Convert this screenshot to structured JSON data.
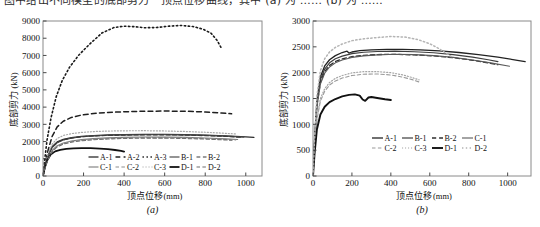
{
  "top_caption": "图中给出不同模型的底部剪力－顶点位移曲线，其中  (a)  为  ……  (b)  为  ……",
  "figure_a": {
    "panel_label": "(a)",
    "axis": {
      "y_title": "底部剪力",
      "y_unit": "(kN)",
      "x_title": "顶点位移",
      "x_unit": "(mm)",
      "x_ticks": [
        0,
        200,
        400,
        600,
        800,
        1000
      ],
      "y_ticks": [
        0,
        1000,
        2000,
        3000,
        4000,
        5000,
        6000,
        7000,
        8000,
        9000
      ],
      "xlim": [
        0,
        1080
      ],
      "ylim": [
        0,
        9000
      ]
    },
    "legend_rows": [
      [
        "A-1",
        "A-2",
        "A-3",
        "B-1",
        "B-2"
      ],
      [
        "C-1",
        "C-2",
        "C-3",
        "D-1",
        "D-2"
      ]
    ]
  },
  "figure_b": {
    "panel_label": "(b)",
    "axis": {
      "y_title": "底部剪力",
      "y_unit": "(kN)",
      "x_title": "顶点位移",
      "x_unit": "(mm)",
      "x_ticks": [
        0,
        200,
        400,
        600,
        800,
        1000
      ],
      "y_ticks": [
        0,
        500,
        1000,
        1500,
        2000,
        2500,
        3000
      ],
      "xlim": [
        0,
        1120
      ],
      "ylim": [
        0,
        3000
      ]
    },
    "legend_rows": [
      [
        "A-1",
        "B-1",
        "B-2",
        "C-1"
      ],
      [
        "C-2",
        "C-3",
        "D-1",
        "D-2"
      ]
    ]
  },
  "chart_data": [
    {
      "type": "line",
      "title": "",
      "panel": "(a)",
      "xlabel": "顶点位移(mm)",
      "ylabel": "底部剪力(kN)",
      "xlim": [
        0,
        1080
      ],
      "ylim": [
        0,
        9000
      ],
      "xticks": [
        0,
        200,
        400,
        600,
        800,
        1000
      ],
      "yticks": [
        0,
        1000,
        2000,
        3000,
        4000,
        5000,
        6000,
        7000,
        8000,
        9000
      ],
      "grid": false,
      "legend_position": "lower-center-inside",
      "series": [
        {
          "name": "A-1",
          "style": "solid",
          "color": "#2b2b2b",
          "width": 1.3,
          "x": [
            0,
            10,
            25,
            45,
            70,
            100,
            140,
            190,
            250,
            320,
            400,
            500,
            600,
            700,
            800,
            900,
            1000,
            1040
          ],
          "y": [
            0,
            600,
            1200,
            1700,
            1980,
            2130,
            2230,
            2300,
            2350,
            2385,
            2405,
            2420,
            2420,
            2405,
            2375,
            2330,
            2270,
            2240
          ]
        },
        {
          "name": "A-2",
          "style": "dashed",
          "color": "#1f1f1f",
          "width": 1.5,
          "x": [
            0,
            10,
            25,
            45,
            70,
            100,
            140,
            190,
            250,
            320,
            400,
            500,
            600,
            700,
            800,
            880,
            930
          ],
          "y": [
            0,
            700,
            1500,
            2300,
            2850,
            3180,
            3400,
            3540,
            3630,
            3690,
            3730,
            3760,
            3770,
            3760,
            3720,
            3660,
            3610
          ]
        },
        {
          "name": "A-3",
          "style": "dotted",
          "color": "#1a1a1a",
          "width": 1.6,
          "x": [
            0,
            8,
            20,
            40,
            65,
            95,
            130,
            175,
            225,
            290,
            350,
            400,
            450,
            500,
            560,
            620,
            680,
            740,
            790,
            830,
            860,
            880
          ],
          "y": [
            0,
            900,
            2100,
            3400,
            4600,
            5550,
            6300,
            7000,
            7600,
            8300,
            8620,
            8700,
            8670,
            8610,
            8620,
            8700,
            8740,
            8680,
            8520,
            8280,
            7850,
            7420
          ]
        },
        {
          "name": "B-1",
          "style": "solid",
          "color": "#4d4d4d",
          "width": 1.2,
          "x": [
            0,
            10,
            25,
            45,
            70,
            100,
            140,
            190,
            250,
            320,
            400,
            500,
            600,
            700,
            800,
            900,
            990
          ],
          "y": [
            0,
            560,
            1150,
            1650,
            1930,
            2090,
            2200,
            2280,
            2330,
            2365,
            2385,
            2400,
            2400,
            2385,
            2355,
            2310,
            2255
          ]
        },
        {
          "name": "B-2",
          "style": "dashed",
          "color": "#3a3a3a",
          "width": 1.2,
          "x": [
            0,
            10,
            25,
            45,
            70,
            100,
            140,
            190,
            250,
            320,
            400,
            500,
            600,
            700,
            800,
            900,
            980
          ],
          "y": [
            0,
            580,
            1180,
            1680,
            1950,
            2100,
            2200,
            2275,
            2325,
            2355,
            2375,
            2390,
            2390,
            2375,
            2345,
            2300,
            2245
          ]
        },
        {
          "name": "C-1",
          "style": "solid",
          "color": "#7a7a7a",
          "width": 1.1,
          "x": [
            0,
            10,
            25,
            45,
            70,
            100,
            140,
            190,
            250,
            320,
            400,
            500,
            600,
            700,
            800,
            900,
            960
          ],
          "y": [
            0,
            500,
            1000,
            1480,
            1760,
            1920,
            2030,
            2110,
            2170,
            2215,
            2245,
            2265,
            2260,
            2240,
            2205,
            2155,
            2115
          ]
        },
        {
          "name": "C-2",
          "style": "dashed",
          "color": "#8e8e8e",
          "width": 1.1,
          "x": [
            0,
            10,
            25,
            45,
            70,
            100,
            140,
            190,
            250,
            320,
            400,
            500,
            600,
            700,
            800,
            900,
            950
          ],
          "y": [
            0,
            480,
            980,
            1440,
            1720,
            1880,
            1995,
            2075,
            2135,
            2180,
            2210,
            2230,
            2228,
            2208,
            2175,
            2125,
            2090
          ]
        },
        {
          "name": "C-3",
          "style": "dotted",
          "color": "#a8a8a8",
          "width": 1.2,
          "x": [
            0,
            10,
            25,
            45,
            70,
            100,
            140,
            190,
            250,
            320,
            400,
            500,
            600,
            700,
            800,
            900,
            950
          ],
          "y": [
            0,
            620,
            1300,
            1850,
            2180,
            2350,
            2460,
            2530,
            2580,
            2610,
            2625,
            2630,
            2615,
            2585,
            2540,
            2480,
            2440
          ]
        },
        {
          "name": "D-1",
          "style": "solid",
          "color": "#111111",
          "width": 1.8,
          "x": [
            0,
            8,
            20,
            38,
            60,
            85,
            115,
            150,
            190,
            235,
            280,
            320,
            355,
            385,
            400
          ],
          "y": [
            0,
            450,
            900,
            1250,
            1430,
            1520,
            1570,
            1600,
            1615,
            1615,
            1595,
            1560,
            1510,
            1455,
            1420
          ]
        },
        {
          "name": "D-2",
          "style": "dashed",
          "color": "#6f6f6f",
          "width": 1.1,
          "x": [
            0,
            10,
            25,
            45,
            70,
            100,
            140,
            190,
            250,
            320,
            400,
            500,
            600,
            700,
            800,
            900,
            930
          ],
          "y": [
            0,
            470,
            960,
            1410,
            1690,
            1850,
            1965,
            2045,
            2105,
            2150,
            2180,
            2200,
            2198,
            2178,
            2145,
            2095,
            2075
          ]
        }
      ]
    },
    {
      "type": "line",
      "title": "",
      "panel": "(b)",
      "xlabel": "顶点位移(mm)",
      "ylabel": "底部剪力(kN)",
      "xlim": [
        0,
        1120
      ],
      "ylim": [
        0,
        3000
      ],
      "xticks": [
        0,
        200,
        400,
        600,
        800,
        1000
      ],
      "yticks": [
        0,
        500,
        1000,
        1500,
        2000,
        2500,
        3000
      ],
      "grid": false,
      "legend_position": "lower-center-inside",
      "series": [
        {
          "name": "A-1",
          "style": "solid",
          "color": "#222222",
          "width": 1.3,
          "x": [
            0,
            8,
            20,
            38,
            60,
            85,
            115,
            150,
            175,
            185,
            200,
            240,
            300,
            380,
            460,
            550,
            650,
            750,
            850,
            950,
            1050,
            1090
          ],
          "y": [
            0,
            700,
            1450,
            1920,
            2130,
            2250,
            2330,
            2390,
            2415,
            2380,
            2400,
            2425,
            2440,
            2450,
            2450,
            2440,
            2420,
            2390,
            2350,
            2300,
            2240,
            2215
          ]
        },
        {
          "name": "B-1",
          "style": "solid",
          "color": "#3d3d3d",
          "width": 1.2,
          "x": [
            0,
            8,
            20,
            38,
            60,
            85,
            115,
            150,
            200,
            260,
            330,
            420,
            520,
            620,
            720,
            820,
            900,
            950
          ],
          "y": [
            0,
            680,
            1400,
            1860,
            2070,
            2190,
            2270,
            2320,
            2370,
            2395,
            2410,
            2415,
            2405,
            2385,
            2350,
            2300,
            2250,
            2215
          ]
        },
        {
          "name": "B-2",
          "style": "dashed",
          "color": "#2e2e2e",
          "width": 1.3,
          "x": [
            0,
            8,
            20,
            38,
            60,
            85,
            115,
            150,
            200,
            260,
            330,
            420,
            520,
            620,
            720,
            820,
            900,
            950
          ],
          "y": [
            0,
            660,
            1360,
            1810,
            2020,
            2140,
            2215,
            2265,
            2310,
            2335,
            2350,
            2355,
            2345,
            2325,
            2290,
            2240,
            2190,
            2155
          ]
        },
        {
          "name": "C-1",
          "style": "solid",
          "color": "#5a5a5a",
          "width": 1.1,
          "x": [
            0,
            8,
            20,
            38,
            60,
            85,
            115,
            150,
            200,
            260,
            330,
            420,
            520,
            620,
            720,
            820,
            920,
            1010
          ],
          "y": [
            0,
            640,
            1330,
            1780,
            1990,
            2110,
            2190,
            2245,
            2295,
            2325,
            2345,
            2355,
            2350,
            2330,
            2295,
            2245,
            2185,
            2125
          ]
        },
        {
          "name": "C-2",
          "style": "dashed",
          "color": "#9a9a9a",
          "width": 1.1,
          "x": [
            0,
            8,
            20,
            38,
            60,
            85,
            115,
            150,
            200,
            260,
            330,
            400,
            460,
            510,
            545
          ],
          "y": [
            0,
            520,
            1080,
            1450,
            1640,
            1760,
            1840,
            1895,
            1945,
            1970,
            1975,
            1955,
            1915,
            1865,
            1820
          ]
        },
        {
          "name": "C-3",
          "style": "dotted",
          "color": "#a5a5a5",
          "width": 1.2,
          "x": [
            0,
            8,
            20,
            38,
            60,
            85,
            115,
            150,
            200,
            260,
            330,
            400,
            460,
            510,
            545
          ],
          "y": [
            0,
            540,
            1120,
            1500,
            1690,
            1810,
            1890,
            1945,
            1995,
            2020,
            2020,
            2000,
            1958,
            1905,
            1860
          ]
        },
        {
          "name": "D-1",
          "style": "solid",
          "color": "#111111",
          "width": 1.9,
          "x": [
            0,
            8,
            20,
            38,
            60,
            85,
            115,
            150,
            185,
            215,
            240,
            255,
            268,
            285,
            300,
            330,
            370,
            400
          ],
          "y": [
            0,
            430,
            900,
            1190,
            1340,
            1430,
            1490,
            1540,
            1570,
            1580,
            1555,
            1480,
            1455,
            1520,
            1530,
            1510,
            1485,
            1470
          ]
        },
        {
          "name": "D-2",
          "style": "dotted",
          "color": "#b4b4b4",
          "width": 1.5,
          "x": [
            0,
            8,
            20,
            38,
            60,
            85,
            115,
            150,
            200,
            260,
            330,
            400,
            470,
            540,
            600,
            650,
            690,
            720
          ],
          "y": [
            0,
            740,
            1550,
            2040,
            2270,
            2400,
            2490,
            2555,
            2620,
            2655,
            2680,
            2700,
            2690,
            2640,
            2560,
            2460,
            2360,
            2290
          ]
        }
      ]
    }
  ]
}
